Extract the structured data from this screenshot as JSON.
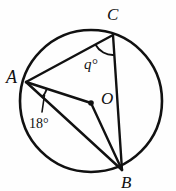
{
  "figure": {
    "type": "circle-geometry-diagram",
    "background_color": "#fefefe",
    "stroke_color": "#111111"
  },
  "circle": {
    "name": "main-circle",
    "center_x": 91,
    "center_y": 101,
    "radius": 71,
    "stroke_width": 2.6
  },
  "points": [
    {
      "id": "A",
      "label": "A",
      "x": 26,
      "y": 82,
      "on_circle": true,
      "label_x": 6,
      "label_y": 68
    },
    {
      "id": "C",
      "label": "C",
      "x": 113,
      "y": 35,
      "on_circle": true,
      "label_x": 107,
      "label_y": 6
    },
    {
      "id": "B",
      "label": "B",
      "x": 122,
      "y": 170,
      "on_circle": true,
      "label_x": 121,
      "label_y": 174
    },
    {
      "id": "O",
      "label": "O",
      "x": 91,
      "y": 103,
      "on_circle": false,
      "label_x": 101,
      "label_y": 90,
      "is_center": true,
      "dot_radius": 2.8
    }
  ],
  "segments": [
    {
      "name": "chord-AC",
      "from": "A",
      "to": "C",
      "stroke_width": 2.4
    },
    {
      "name": "chord-CB",
      "from": "C",
      "to": "B",
      "stroke_width": 2.4
    },
    {
      "name": "radius-AO",
      "from": "A",
      "to": "O",
      "stroke_width": 2.4
    },
    {
      "name": "radius-OB",
      "from": "O",
      "to": "B",
      "stroke_width": 2.4
    },
    {
      "name": "chord-AB",
      "from": "A",
      "to": "B",
      "stroke_width": 2.4
    }
  ],
  "angles": [
    {
      "name": "angle-at-C",
      "vertex": "C",
      "label": "q°",
      "value_text": "q",
      "unit": "°",
      "between": [
        "CA",
        "CB"
      ],
      "arc_radius": 20,
      "label_x": 84,
      "label_y": 57
    },
    {
      "name": "angle-at-A",
      "vertex": "A",
      "label": "18°",
      "value_text": "18",
      "unit": "°",
      "between": [
        "AO",
        "AB"
      ],
      "arc_radius": 22,
      "label_x": 29,
      "label_y": 117
    }
  ]
}
